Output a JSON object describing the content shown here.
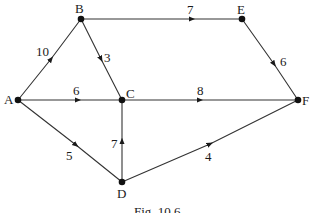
{
  "diagram": {
    "type": "weighted-directed-graph",
    "caption": "Fig. 10.6",
    "nodes": [
      {
        "id": "A",
        "label": "A",
        "x": 18,
        "y": 100
      },
      {
        "id": "B",
        "label": "B",
        "x": 81,
        "y": 19
      },
      {
        "id": "C",
        "label": "C",
        "x": 122,
        "y": 100
      },
      {
        "id": "D",
        "label": "D",
        "x": 122,
        "y": 182
      },
      {
        "id": "E",
        "label": "E",
        "x": 242,
        "y": 19
      },
      {
        "id": "F",
        "label": "F",
        "x": 298,
        "y": 100
      }
    ],
    "edges": [
      {
        "from": "A",
        "to": "B",
        "weight": "10"
      },
      {
        "from": "A",
        "to": "C",
        "weight": "6"
      },
      {
        "from": "A",
        "to": "D",
        "weight": "5"
      },
      {
        "from": "B",
        "to": "C",
        "weight": "3"
      },
      {
        "from": "B",
        "to": "E",
        "weight": "7"
      },
      {
        "from": "C",
        "to": "F",
        "weight": "8"
      },
      {
        "from": "D",
        "to": "C",
        "weight": "7"
      },
      {
        "from": "D",
        "to": "F",
        "weight": "4"
      },
      {
        "from": "E",
        "to": "F",
        "weight": "6"
      }
    ]
  }
}
